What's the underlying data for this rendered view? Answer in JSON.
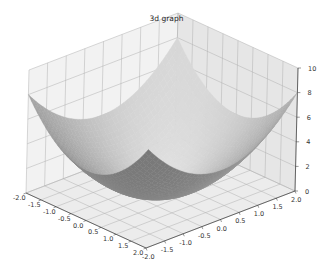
{
  "figure": {
    "title": "3d graph",
    "background": "#ffffff"
  },
  "chart_data": {
    "type": "surface",
    "title": "3d graph",
    "function": "z = x^2 + y^2",
    "xlabel": "",
    "ylabel": "",
    "zlabel": "",
    "x_ticks": [
      "-2.0",
      "-1.5",
      "-1.0",
      "-0.5",
      "0.0",
      "0.5",
      "1.0",
      "1.5",
      "2.0"
    ],
    "y_ticks": [
      "-2.0",
      "-1.5",
      "-1.0",
      "-0.5",
      "0.0",
      "0.5",
      "1.0",
      "1.5",
      "2.0"
    ],
    "z_ticks": [
      "0",
      "2",
      "4",
      "6",
      "8",
      "10"
    ],
    "xlim": [
      -2,
      2
    ],
    "ylim": [
      -2,
      2
    ],
    "zlim": [
      0,
      10
    ],
    "grid": true,
    "colormap": "grayscale",
    "pane_color": "#ebebeb",
    "grid_color": "#b0b0b0"
  }
}
